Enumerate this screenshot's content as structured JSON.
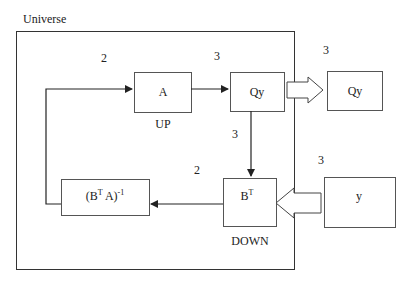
{
  "diagram": {
    "container_label": "Universe",
    "boxes": {
      "a": {
        "label": "A",
        "caption": "UP"
      },
      "qy_inner": {
        "label": "Qy"
      },
      "qy_outer": {
        "label": "Qy"
      },
      "inverse": {
        "base": "(B",
        "sup1": "T",
        "mid": " A)",
        "sup2": "-1"
      },
      "bt": {
        "base": "B",
        "sup": "T",
        "caption": "DOWN"
      },
      "y": {
        "label": "y"
      }
    },
    "edge_labels": {
      "feedback_to_a": "2",
      "a_to_qy": "3",
      "qy_out": "3",
      "qy_to_bt": "3",
      "bt_to_inverse": "2",
      "y_in": "3"
    },
    "colors": {
      "stroke": "#333333",
      "background": "#ffffff"
    }
  }
}
